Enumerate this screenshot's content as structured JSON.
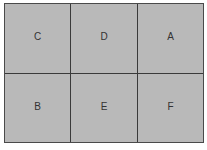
{
  "grid": {
    "rows": [
      [
        "C",
        "D",
        "A"
      ],
      [
        "B",
        "E",
        "F"
      ]
    ],
    "cells": [
      "C",
      "D",
      "A",
      "B",
      "E",
      "F"
    ]
  },
  "colors": {
    "cell_fill": "#b9b9b9",
    "border": "#3a3a3a",
    "label": "#333333"
  }
}
